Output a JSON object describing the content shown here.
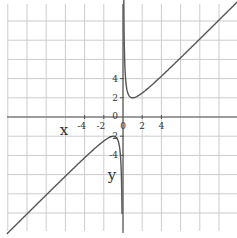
{
  "chart_data": {
    "type": "line",
    "title": "",
    "function": "y = x + 1/x",
    "xlabel": "x",
    "ylabel": "y",
    "xlim": [
      -12,
      12
    ],
    "ylim": [
      -11.8,
      11.9
    ],
    "grid": true,
    "grid_step": 2,
    "x_ticks": [
      -4,
      -2,
      0,
      2,
      4
    ],
    "x_tick_labels": [
      "-4",
      "-2",
      "0",
      "2",
      "4"
    ],
    "y_ticks": [
      4,
      2,
      0,
      -2,
      -4
    ],
    "y_tick_labels": [
      "4",
      "2",
      "0",
      "-2",
      "-4"
    ],
    "series": [
      {
        "name": "right branch (x > 0)",
        "x": [
          0.08,
          0.1,
          0.2,
          0.3,
          0.5,
          0.75,
          1,
          1.5,
          2,
          3,
          4,
          6,
          8,
          10,
          11.9
        ],
        "values": [
          12.58,
          10.1,
          5.2,
          3.63,
          2.5,
          2.08,
          2,
          2.17,
          2.5,
          3.33,
          4.25,
          6.17,
          8.13,
          10.1,
          11.98
        ]
      },
      {
        "name": "left branch (x < 0)",
        "x": [
          -12.1,
          -10,
          -8,
          -6,
          -4,
          -3,
          -2,
          -1.5,
          -1,
          -0.75,
          -0.5,
          -0.3,
          -0.2,
          -0.1
        ],
        "values": [
          -12.18,
          -10.1,
          -8.13,
          -6.17,
          -4.25,
          -3.33,
          -2.5,
          -2.17,
          -2,
          -2.08,
          -2.5,
          -3.63,
          -5.2,
          -10.1
        ]
      }
    ],
    "key_points": {
      "local_min": [
        1,
        2
      ],
      "local_max": [
        -1,
        -2
      ]
    }
  },
  "axes": {
    "x_label": "x",
    "y_label": "y",
    "origin_label": "0"
  },
  "colors": {
    "curve": "#555555",
    "grid": "#cccccc",
    "axis": "#555555",
    "text": "#333333"
  }
}
